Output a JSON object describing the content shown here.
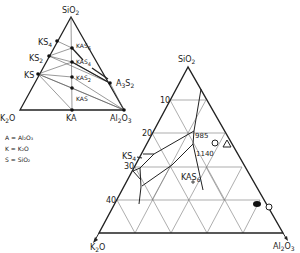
{
  "small_diagram": {
    "vertices": {
      "top": "SiO2",
      "left": "K2O",
      "right": "Al2O3"
    },
    "labels": {
      "sio2": "SiO",
      "sio2_sub": "2",
      "k2o": "K",
      "k2o_sub": "2",
      "k2o_tail": "O",
      "al2o3": "Al",
      "al2o3_sub1": "2",
      "al2o3_mid": "O",
      "al2o3_sub2": "3",
      "ks4": "KS",
      "ks4_sub": "4",
      "ks2": "KS",
      "ks2_sub": "2",
      "ks": "KS",
      "kas6": "KAS",
      "kas6_sub": "6",
      "kas4": "KAS",
      "kas4_sub": "4",
      "kas2": "KAS",
      "kas2_sub": "2",
      "kas": "KAS",
      "ka": "KA",
      "a3s2": "A",
      "a3s2_sub1": "3",
      "a3s2_mid": "S",
      "a3s2_sub2": "2"
    },
    "compounds": [
      "KS4",
      "KS2",
      "KS",
      "KAS6",
      "KAS4",
      "KAS2",
      "KAS",
      "KA",
      "A3S2"
    ]
  },
  "legend": {
    "line1": "A = Al₂O₃",
    "line2": "K = K₂O",
    "line3": "S = SiO₂"
  },
  "large_diagram": {
    "vertices": {
      "top": "SiO2",
      "left": "K2O",
      "right": "Al2O3"
    },
    "labels": {
      "sio2": "SiO",
      "sio2_sub": "2",
      "k2o": "K",
      "k2o_sub": "2",
      "k2o_tail": "O",
      "al2o3": "Al",
      "al2o3_sub1": "2",
      "al2o3_mid": "O",
      "al2o3_sub2": "3",
      "ks4": "KS",
      "ks4_sub": "4",
      "kas6": "KAS",
      "kas6_sub": "6"
    },
    "axis_ticks": [
      "10",
      "20",
      "30",
      "40"
    ],
    "temperatures": [
      "985",
      "1140"
    ],
    "markers": [
      "circle",
      "triangle",
      "filled-blob",
      "circle"
    ]
  }
}
